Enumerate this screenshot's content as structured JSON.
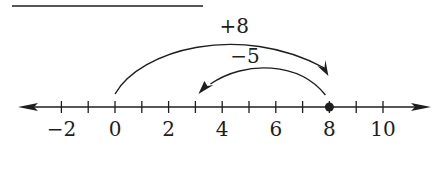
{
  "diagram": {
    "type": "number-line",
    "axis": {
      "min": -3,
      "max": 11,
      "tick_step": 1
    },
    "tick_values": [
      -2,
      -1,
      0,
      1,
      2,
      3,
      4,
      5,
      6,
      7,
      8,
      9,
      10
    ],
    "labels": [
      {
        "value": -2,
        "text": "−2"
      },
      {
        "value": 0,
        "text": "0"
      },
      {
        "value": 2,
        "text": "2"
      },
      {
        "value": 4,
        "text": "4"
      },
      {
        "value": 6,
        "text": "6"
      },
      {
        "value": 8,
        "text": "8"
      },
      {
        "value": 10,
        "text": "10"
      }
    ],
    "point": 8,
    "jumps": [
      {
        "from": 0,
        "to": 8,
        "label": "+8"
      },
      {
        "from": 8,
        "to": 3,
        "label": "−5"
      }
    ],
    "color": "#1e1e1e"
  }
}
